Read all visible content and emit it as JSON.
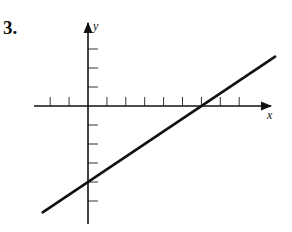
{
  "problem": {
    "number": "3."
  },
  "chart_data": {
    "type": "line",
    "title": "",
    "xlabel": "x",
    "ylabel": "y",
    "x_ticks": [
      -2,
      -1,
      1,
      2,
      3,
      4,
      5,
      6,
      7,
      8
    ],
    "y_ticks": [
      -5,
      -4,
      -3,
      -2,
      -1,
      1,
      2,
      3
    ],
    "xlim": [
      -2.9,
      9.9
    ],
    "ylim": [
      -6.1,
      4.4
    ],
    "grid": false,
    "tick_labels_shown": false,
    "series": [
      {
        "name": "line",
        "equation": "y = (2/3)x - 4",
        "slope": 0.6667,
        "y_intercept": -4,
        "x_intercept": 6,
        "x": [
          -2.4,
          9.9
        ],
        "y": [
          -5.6,
          2.6
        ]
      }
    ]
  },
  "style": {
    "ink": "#111111",
    "background": "#ffffff"
  }
}
